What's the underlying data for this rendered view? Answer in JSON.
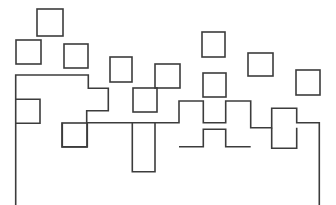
{
  "figure": {
    "width": 336,
    "height": 205,
    "background_color": "#ffffff",
    "stroke_color": "#3c3c3c",
    "stroke_width": 1.6,
    "style": "line-art, unfilled outlines"
  },
  "shapes": {
    "squares": [
      {
        "name": "square-top-left-upper",
        "x": 37,
        "y": 9,
        "w": 26,
        "h": 27
      },
      {
        "name": "square-far-left",
        "x": 16,
        "y": 40,
        "w": 25,
        "h": 24
      },
      {
        "name": "square-left-mid",
        "x": 64,
        "y": 44,
        "w": 24,
        "h": 24
      },
      {
        "name": "square-center-upper",
        "x": 110,
        "y": 57,
        "w": 22,
        "h": 25
      },
      {
        "name": "square-center-right",
        "x": 155,
        "y": 64,
        "w": 25,
        "h": 24
      },
      {
        "name": "square-center-lower",
        "x": 133,
        "y": 88,
        "w": 24,
        "h": 24
      },
      {
        "name": "square-right-upper",
        "x": 202,
        "y": 32,
        "w": 23,
        "h": 25
      },
      {
        "name": "square-far-right-upper",
        "x": 248,
        "y": 53,
        "w": 25,
        "h": 23
      },
      {
        "name": "square-right-mid",
        "x": 203,
        "y": 73,
        "w": 23,
        "h": 24
      },
      {
        "name": "square-far-right-edge",
        "x": 296,
        "y": 70,
        "w": 24,
        "h": 25
      },
      {
        "name": "square-lower-left",
        "x": 62,
        "y": 123,
        "w": 25,
        "h": 24
      }
    ],
    "path": {
      "name": "rectilinear-skyline-path",
      "d": "M 15.7 205 L 15.7 75 L 88.3 75 L 88.3 88.3 L 108.3 88.3 L 108.3 110.7 L 86.7 110.7 L 86.7 122.7 L 179 122.7 L 179 101 L 203.3 101 L 203.3 122.7 L 225.7 122.7 L 225.7 101 L 250.7 101 L 250.7 127.7 L 271.7 127.7 L 271.7 108.3 L 296.7 108.3 L 296.7 122.7 L 319.3 122.7 L 319.3 205"
    },
    "secondary_paths": [
      {
        "name": "left-notch-path",
        "d": "M 15.7 99.3 L 40 99.3 L 40 123.3 L 15.7 123.3"
      },
      {
        "name": "center-drop-path",
        "d": "M 132.3 122.7 L 132.3 171.7 L 155 171.7 L 155 122.7"
      },
      {
        "name": "right-dip-path",
        "d": "M 179 146.7 L 203.3 146.7 L 203.3 129.3 L 225.7 129.3 L 225.7 146.7 L 250.7 146.7"
      },
      {
        "name": "right-box-lower",
        "d": "M 271.7 127.7 L 271.7 148.3 L 296.7 148.3 L 296.7 127.7"
      },
      {
        "name": "lower-left-square-join",
        "d": "M 62.3 122.7 L 62.3 146.7 L 87.3 146.7 L 87.3 122.7"
      }
    ]
  },
  "labels": {
    "figure_caption": ""
  }
}
